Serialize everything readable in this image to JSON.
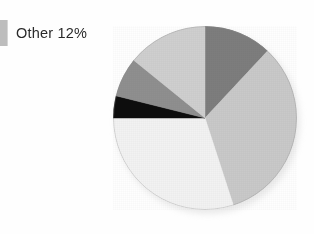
{
  "legend": {
    "items": [
      {
        "label": "Other 12%",
        "color": "#bdbdbd",
        "swatch_name": "legend-swatch-other"
      }
    ]
  },
  "chart_data": {
    "type": "pie",
    "title": "",
    "xlabel": "",
    "ylabel": "",
    "legend_position": "left",
    "grid": false,
    "center": {
      "x": 205,
      "y": 118
    },
    "radius": 92,
    "start_angle_deg": 0,
    "direction": "clockwise",
    "labels": [
      "Other",
      "Segment 2",
      "Segment 3",
      "Segment 4",
      "Segment 5",
      "Segment 6"
    ],
    "values": [
      12,
      33,
      30,
      4,
      7,
      14
    ],
    "unit": "%",
    "annotations": [
      "Other 12%"
    ],
    "slices": [
      {
        "label": "Other",
        "value": 12,
        "color": "#7d7d7d",
        "start_deg": 0,
        "end_deg": 43
      },
      {
        "label": "Segment 2",
        "value": 33,
        "color": "#c9c9c9",
        "start_deg": 43,
        "end_deg": 162
      },
      {
        "label": "Segment 3",
        "value": 30,
        "color": "#f2f2f2",
        "start_deg": 162,
        "end_deg": 270
      },
      {
        "label": "Segment 4",
        "value": 4,
        "color": "#0d0d0d",
        "start_deg": 270,
        "end_deg": 284
      },
      {
        "label": "Segment 5",
        "value": 7,
        "color": "#8f8f8f",
        "start_deg": 284,
        "end_deg": 309
      },
      {
        "label": "Segment 6",
        "value": 14,
        "color": "#cfcfcf",
        "start_deg": 309,
        "end_deg": 360
      }
    ]
  }
}
